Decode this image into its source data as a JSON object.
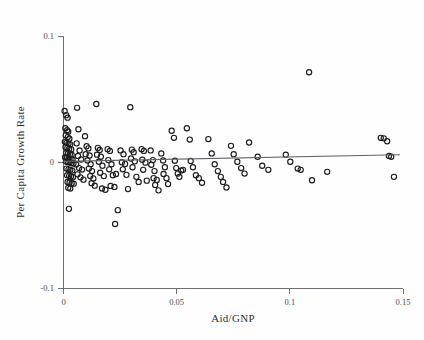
{
  "figure": {
    "background_color": "#fefefe",
    "point_color": "#1d1d1d",
    "line_color": "#62626a",
    "axis_color": "#6e6e74"
  },
  "axes": {
    "x_title": "Aid/GNP",
    "y_title": "Per Capita Growth Rate",
    "x_ticks": [
      "0",
      "0.05",
      "0.1",
      "0.15"
    ],
    "y_ticks": [
      "0.1",
      "0",
      "-0.1"
    ]
  },
  "chart_data": {
    "type": "scatter",
    "title": "",
    "xlabel": "Aid/GNP",
    "ylabel": "Per Capita Growth Rate",
    "xlim": [
      0,
      0.15
    ],
    "ylim": [
      -0.1,
      0.1
    ],
    "xticks": [
      0,
      0.05,
      0.1,
      0.15
    ],
    "yticks": [
      -0.1,
      0,
      0.1
    ],
    "grid": false,
    "legend": null,
    "marker": "open-circle",
    "n_points": 148,
    "fit_line": {
      "type": "linear-regression",
      "x_start": 0.0,
      "y_start": 0.0005,
      "x_end": 0.1487,
      "y_end": 0.0058
    },
    "points": [
      [
        0.0005,
        0.0405
      ],
      [
        0.0012,
        0.0372
      ],
      [
        0.0018,
        0.0352
      ],
      [
        0.0008,
        0.0268
      ],
      [
        0.0016,
        0.0252
      ],
      [
        0.0021,
        0.024
      ],
      [
        0.001,
        0.0212
      ],
      [
        0.0019,
        0.0198
      ],
      [
        0.0026,
        0.0185
      ],
      [
        0.0006,
        0.016
      ],
      [
        0.0014,
        0.0152
      ],
      [
        0.0022,
        0.0146
      ],
      [
        0.003,
        0.014
      ],
      [
        0.0009,
        0.0118
      ],
      [
        0.0017,
        0.0112
      ],
      [
        0.0025,
        0.0105
      ],
      [
        0.0034,
        0.01
      ],
      [
        0.0012,
        0.0072
      ],
      [
        0.002,
        0.0068
      ],
      [
        0.0028,
        0.0062
      ],
      [
        0.0036,
        0.0058
      ],
      [
        0.0007,
        0.0038
      ],
      [
        0.0015,
        0.0032
      ],
      [
        0.0023,
        0.0028
      ],
      [
        0.0031,
        0.0022
      ],
      [
        0.004,
        0.0018
      ],
      [
        0.0011,
        0.0004
      ],
      [
        0.0019,
        0.0
      ],
      [
        0.0027,
        -0.0004
      ],
      [
        0.0035,
        -0.0008
      ],
      [
        0.0044,
        -0.0012
      ],
      [
        0.0013,
        -0.0052
      ],
      [
        0.0022,
        -0.0058
      ],
      [
        0.003,
        -0.0062
      ],
      [
        0.0039,
        -0.0068
      ],
      [
        0.0016,
        -0.0105
      ],
      [
        0.0025,
        -0.011
      ],
      [
        0.0033,
        -0.0115
      ],
      [
        0.0042,
        -0.012
      ],
      [
        0.0018,
        -0.0158
      ],
      [
        0.0027,
        -0.0162
      ],
      [
        0.0036,
        -0.0168
      ],
      [
        0.0045,
        -0.0172
      ],
      [
        0.0021,
        -0.0205
      ],
      [
        0.003,
        -0.021
      ],
      [
        0.0024,
        -0.0372
      ],
      [
        0.006,
        0.043
      ],
      [
        0.0066,
        0.026
      ],
      [
        0.0058,
        0.0148
      ],
      [
        0.0071,
        0.0092
      ],
      [
        0.0064,
        0.0048
      ],
      [
        0.0078,
        0.002
      ],
      [
        0.0056,
        -0.002
      ],
      [
        0.0069,
        -0.0048
      ],
      [
        0.0082,
        -0.006
      ],
      [
        0.0062,
        -0.0098
      ],
      [
        0.0075,
        -0.0122
      ],
      [
        0.0088,
        -0.014
      ],
      [
        0.0095,
        0.0205
      ],
      [
        0.0102,
        0.0125
      ],
      [
        0.011,
        0.0108
      ],
      [
        0.0098,
        0.0062
      ],
      [
        0.0115,
        0.0052
      ],
      [
        0.0106,
        0.0012
      ],
      [
        0.012,
        -0.0018
      ],
      [
        0.0112,
        -0.0052
      ],
      [
        0.0126,
        -0.0072
      ],
      [
        0.0118,
        -0.0112
      ],
      [
        0.0132,
        -0.013
      ],
      [
        0.0124,
        -0.0168
      ],
      [
        0.0138,
        -0.0188
      ],
      [
        0.0145,
        0.046
      ],
      [
        0.0152,
        0.0112
      ],
      [
        0.016,
        0.0095
      ],
      [
        0.0148,
        0.0058
      ],
      [
        0.0165,
        0.0042
      ],
      [
        0.0156,
        0.0002
      ],
      [
        0.0172,
        -0.003
      ],
      [
        0.0162,
        -0.0085
      ],
      [
        0.0178,
        -0.0112
      ],
      [
        0.017,
        -0.021
      ],
      [
        0.0185,
        -0.022
      ],
      [
        0.0195,
        0.0102
      ],
      [
        0.0205,
        0.0088
      ],
      [
        0.0198,
        0.0015
      ],
      [
        0.0212,
        -0.0018
      ],
      [
        0.0202,
        -0.0058
      ],
      [
        0.0218,
        -0.0105
      ],
      [
        0.0208,
        -0.019
      ],
      [
        0.0225,
        -0.0198
      ],
      [
        0.0232,
        -0.0095
      ],
      [
        0.024,
        -0.0382
      ],
      [
        0.0228,
        -0.0492
      ],
      [
        0.0252,
        0.0092
      ],
      [
        0.0265,
        0.0062
      ],
      [
        0.0258,
        -0.0002
      ],
      [
        0.0272,
        -0.0015
      ],
      [
        0.0262,
        -0.0058
      ],
      [
        0.0278,
        -0.0102
      ],
      [
        0.0285,
        -0.0215
      ],
      [
        0.0295,
        0.0435
      ],
      [
        0.0302,
        0.0098
      ],
      [
        0.031,
        0.0078
      ],
      [
        0.0298,
        0.0028
      ],
      [
        0.0315,
        0.0005
      ],
      [
        0.0305,
        -0.0042
      ],
      [
        0.0322,
        -0.0118
      ],
      [
        0.0332,
        -0.0158
      ],
      [
        0.0345,
        0.0102
      ],
      [
        0.0355,
        0.0088
      ],
      [
        0.0348,
        0.0018
      ],
      [
        0.0362,
        -0.0005
      ],
      [
        0.0352,
        -0.0062
      ],
      [
        0.0368,
        -0.0148
      ],
      [
        0.0385,
        0.0092
      ],
      [
        0.0395,
        0.0015
      ],
      [
        0.0388,
        -0.0022
      ],
      [
        0.0402,
        -0.0072
      ],
      [
        0.0398,
        -0.0128
      ],
      [
        0.0412,
        -0.0142
      ],
      [
        0.0405,
        -0.0182
      ],
      [
        0.042,
        -0.0225
      ],
      [
        0.0432,
        0.0068
      ],
      [
        0.044,
        0.0012
      ],
      [
        0.0448,
        -0.0042
      ],
      [
        0.0442,
        -0.0095
      ],
      [
        0.0455,
        -0.0128
      ],
      [
        0.0462,
        -0.0175
      ],
      [
        0.0478,
        0.0248
      ],
      [
        0.0488,
        0.0192
      ],
      [
        0.0492,
        0.001
      ],
      [
        0.0498,
        -0.0048
      ],
      [
        0.0505,
        -0.0092
      ],
      [
        0.0512,
        -0.0118
      ],
      [
        0.052,
        -0.0068
      ],
      [
        0.0528,
        -0.0062
      ],
      [
        0.0545,
        0.0268
      ],
      [
        0.0558,
        0.0178
      ],
      [
        0.0562,
        0.0008
      ],
      [
        0.0572,
        -0.0042
      ],
      [
        0.0585,
        -0.0105
      ],
      [
        0.0598,
        -0.0128
      ],
      [
        0.0612,
        -0.0165
      ],
      [
        0.064,
        0.0182
      ],
      [
        0.0655,
        0.0068
      ],
      [
        0.0668,
        -0.0018
      ],
      [
        0.0682,
        -0.0072
      ],
      [
        0.0695,
        -0.0118
      ],
      [
        0.0705,
        -0.0158
      ],
      [
        0.072,
        -0.0202
      ],
      [
        0.074,
        0.0128
      ],
      [
        0.0752,
        0.0062
      ],
      [
        0.0768,
        0.0002
      ],
      [
        0.0785,
        -0.0048
      ],
      [
        0.08,
        -0.0092
      ],
      [
        0.082,
        0.0155
      ],
      [
        0.0858,
        0.0042
      ],
      [
        0.0878,
        -0.003
      ],
      [
        0.0905,
        -0.0062
      ],
      [
        0.0982,
        0.0058
      ],
      [
        0.1002,
        0.0002
      ],
      [
        0.1035,
        -0.0052
      ],
      [
        0.1048,
        -0.0062
      ],
      [
        0.1085,
        0.0712
      ],
      [
        0.1098,
        -0.0145
      ],
      [
        0.1165,
        -0.0078
      ],
      [
        0.1402,
        0.0192
      ],
      [
        0.1415,
        0.0188
      ],
      [
        0.143,
        0.0165
      ],
      [
        0.1438,
        0.0048
      ],
      [
        0.1448,
        0.0042
      ],
      [
        0.146,
        -0.0118
      ]
    ]
  }
}
